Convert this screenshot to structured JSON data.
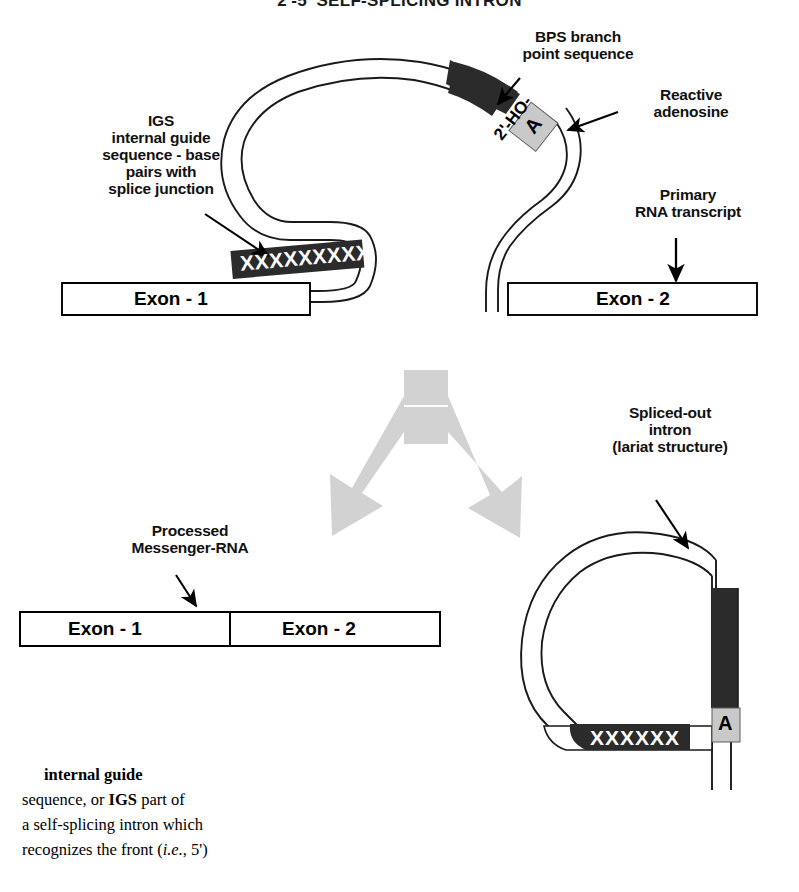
{
  "figure": {
    "title": "2'-5' SELF-SPLICING INTRON",
    "labels": {
      "bps": "BPS branch\npoint sequence",
      "reactive_adenosine": "Reactive\nadenosine",
      "igs": "IGS\ninternal guide\nsequence - base\npairs with\nsplice junction",
      "primary_transcript": "Primary\nRNA transcript",
      "processed_mrna": "Processed\nMessenger-RNA",
      "spliced_out_intron": "Spliced-out\nintron\n(lariat structure)"
    },
    "top_panel": {
      "exon1": "Exon - 1",
      "exon2": "Exon - 2",
      "igs_sequence": "XXXXXXXXX",
      "adenosine_letter": "A",
      "hydroxyl": "2'-HO-"
    },
    "bottom_left_panel": {
      "exon1": "Exon - 1",
      "exon2": "Exon - 2"
    },
    "lariat_panel": {
      "igs_sequence": "XXXXXX",
      "adenosine_letter": "A"
    },
    "caption": {
      "lead": "internal  guide",
      "line2_a": "sequence",
      "line2_b": ", or ",
      "line2_c": "IGS",
      "line2_d": "    part of",
      "line3": "a self-splicing intron which",
      "line4_a": "recognizes the front (",
      "line4_b": "i.e.",
      "line4_c": ", 5')"
    },
    "colors": {
      "ink": "#000000",
      "dark_block": "#2b2b2b",
      "gray_arrow": "#d2d2d2",
      "adenosine_box": "#c9c9c9",
      "paper": "#ffffff"
    }
  }
}
